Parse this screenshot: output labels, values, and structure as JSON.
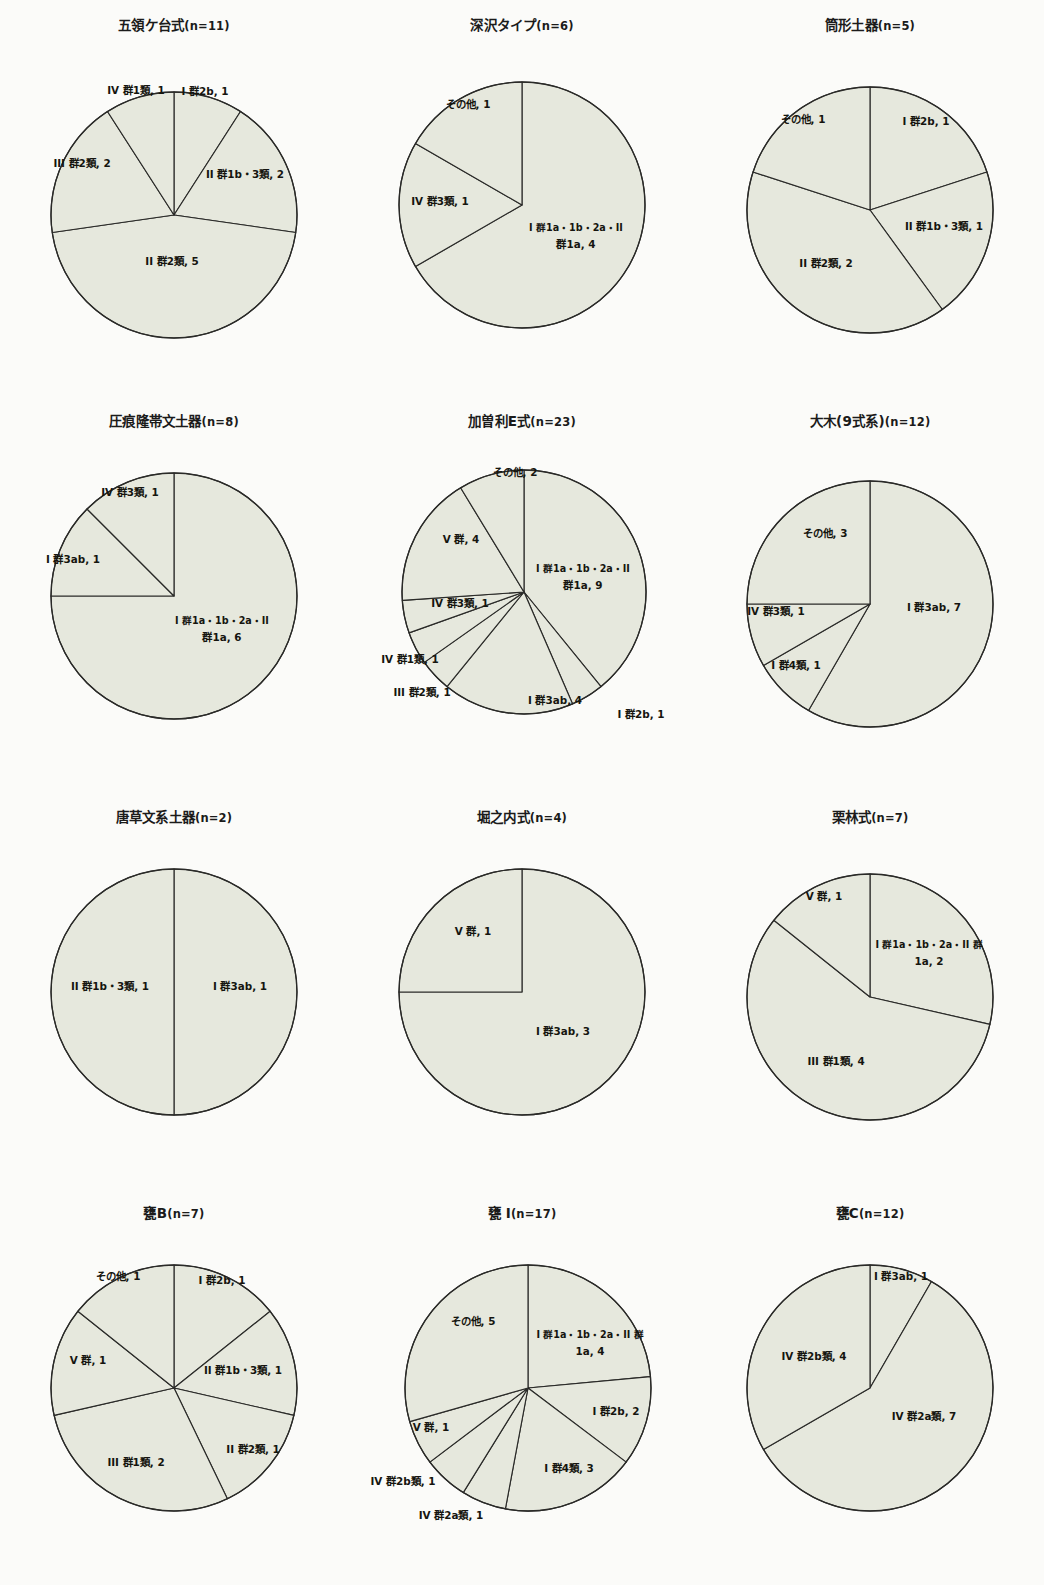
{
  "page": {
    "background_color": "#fbfbf9",
    "slice_fill_color": "#e6e8dd",
    "slice_stroke_color": "#2a2a28",
    "text_color": "#15150f",
    "columns": 3,
    "rows": 4
  },
  "chart_data": [
    {
      "type": "pie",
      "title": "五領ケ台式",
      "n_label": "(n=11)",
      "total": 11,
      "cx": 174,
      "cy": 215,
      "r": 123,
      "start_angle": 0,
      "direction": "clockwise",
      "categories": [
        "I 群2b",
        "II 群1b・3類",
        "II 群2類",
        "III 群2類",
        "IV 群1類"
      ],
      "values": [
        1,
        2,
        5,
        2,
        1
      ],
      "labels": [
        {
          "text": "I 群2b, 1",
          "x": 205,
          "y": 95,
          "anchor": "middle"
        },
        {
          "text": "II 群1b・3類, 2",
          "x": 245,
          "y": 178,
          "anchor": "middle"
        },
        {
          "text": "II 群2類, 5",
          "x": 172,
          "y": 265,
          "anchor": "middle"
        },
        {
          "text": "III 群2類, 2",
          "x": 82,
          "y": 167,
          "anchor": "middle"
        },
        {
          "text": "IV 群1類, 1",
          "x": 136,
          "y": 94,
          "anchor": "middle"
        }
      ]
    },
    {
      "type": "pie",
      "title": "深沢タイプ",
      "n_label": "(n=6)",
      "total": 6,
      "cx": 174,
      "cy": 205,
      "r": 123,
      "start_angle": 0,
      "direction": "clockwise",
      "categories": [
        "I 群1a・1b・2a・II 群1a",
        "IV 群3類",
        "その他"
      ],
      "values": [
        4,
        1,
        1
      ],
      "labels": [
        {
          "text": "I 群1a・1b・2a・II",
          "x": 228,
          "y": 231,
          "anchor": "middle"
        },
        {
          "text": "群1a, 4",
          "x": 228,
          "y": 248,
          "anchor": "middle"
        },
        {
          "text": "IV 群3類, 1",
          "x": 92,
          "y": 205,
          "anchor": "middle"
        },
        {
          "text": "その他, 1",
          "x": 120,
          "y": 108,
          "anchor": "middle"
        }
      ]
    },
    {
      "type": "pie",
      "title": "筒形土器",
      "n_label": "(n=5)",
      "total": 5,
      "cx": 174,
      "cy": 210,
      "r": 123,
      "start_angle": 0,
      "direction": "clockwise",
      "categories": [
        "I 群2b",
        "II 群1b・3類",
        "II 群2類",
        "その他"
      ],
      "values": [
        1,
        1,
        2,
        1
      ],
      "labels": [
        {
          "text": "I 群2b, 1",
          "x": 230,
          "y": 125,
          "anchor": "middle"
        },
        {
          "text": "II 群1b・3類, 1",
          "x": 248,
          "y": 230,
          "anchor": "middle"
        },
        {
          "text": "II 群2類, 2",
          "x": 130,
          "y": 267,
          "anchor": "middle"
        },
        {
          "text": "その他, 1",
          "x": 107,
          "y": 123,
          "anchor": "middle"
        }
      ]
    },
    {
      "type": "pie",
      "title": "圧痕隆帯文土器",
      "n_label": "(n=8)",
      "total": 8,
      "cx": 174,
      "cy": 200,
      "r": 123,
      "start_angle": 0,
      "direction": "clockwise",
      "categories": [
        "I 群1a・1b・2a・II 群1a",
        "I 群3ab",
        "IV 群3類"
      ],
      "values": [
        6,
        1,
        1
      ],
      "labels": [
        {
          "text": "I 群1a・1b・2a・II",
          "x": 222,
          "y": 228,
          "anchor": "middle"
        },
        {
          "text": "群1a, 6",
          "x": 222,
          "y": 245,
          "anchor": "middle"
        },
        {
          "text": "I 群3ab, 1",
          "x": 73,
          "y": 167,
          "anchor": "middle"
        },
        {
          "text": "IV 群3類, 1",
          "x": 130,
          "y": 100,
          "anchor": "middle"
        }
      ]
    },
    {
      "type": "pie",
      "title": "加曽利E式",
      "n_label": "(n=23)",
      "total": 23,
      "cx": 176,
      "cy": 196,
      "r": 122,
      "start_angle": 0,
      "direction": "clockwise",
      "categories": [
        "I 群1a・1b・2a・II 群1a",
        "I 群2b",
        "I 群3ab",
        "III 群2類",
        "IV 群1類",
        "IV 群3類",
        "V 群",
        "その他"
      ],
      "values": [
        9,
        1,
        4,
        1,
        1,
        1,
        4,
        2
      ],
      "labels": [
        {
          "text": "I 群1a・1b・2a・II",
          "x": 235,
          "y": 176,
          "anchor": "middle"
        },
        {
          "text": "群1a, 9",
          "x": 235,
          "y": 193,
          "anchor": "middle"
        },
        {
          "text": "I 群2b, 1",
          "x": 293,
          "y": 322,
          "anchor": "middle"
        },
        {
          "text": "I 群3ab, 4",
          "x": 207,
          "y": 308,
          "anchor": "middle"
        },
        {
          "text": "III 群2類, 1",
          "x": 74,
          "y": 300,
          "anchor": "middle"
        },
        {
          "text": "IV 群1類, 1",
          "x": 62,
          "y": 267,
          "anchor": "middle"
        },
        {
          "text": "IV 群3類, 1",
          "x": 112,
          "y": 211,
          "anchor": "middle"
        },
        {
          "text": "V 群, 4",
          "x": 113,
          "y": 147,
          "anchor": "middle"
        },
        {
          "text": "その他, 2",
          "x": 167,
          "y": 80,
          "anchor": "middle"
        }
      ]
    },
    {
      "type": "pie",
      "title": "大木(9式系)",
      "n_label": "(n=12)",
      "total": 12,
      "cx": 174,
      "cy": 208,
      "r": 123,
      "start_angle": 0,
      "direction": "clockwise",
      "categories": [
        "I 群3ab",
        "I 群4類",
        "IV 群3類",
        "その他"
      ],
      "values": [
        7,
        1,
        1,
        3
      ],
      "labels": [
        {
          "text": "I 群3ab, 7",
          "x": 238,
          "y": 215,
          "anchor": "middle"
        },
        {
          "text": "I 群4類, 1",
          "x": 100,
          "y": 273,
          "anchor": "middle"
        },
        {
          "text": "IV 群3類, 1",
          "x": 80,
          "y": 219,
          "anchor": "middle"
        },
        {
          "text": "その他, 3",
          "x": 129,
          "y": 141,
          "anchor": "middle"
        }
      ]
    },
    {
      "type": "pie",
      "title": "唐草文系土器",
      "n_label": "(n=2)",
      "total": 2,
      "cx": 174,
      "cy": 200,
      "r": 123,
      "start_angle": 0,
      "direction": "clockwise",
      "categories": [
        "I 群3ab",
        "II 群1b・3類"
      ],
      "values": [
        1,
        1
      ],
      "labels": [
        {
          "text": "I 群3ab, 1",
          "x": 240,
          "y": 198,
          "anchor": "middle"
        },
        {
          "text": "II 群1b・3類, 1",
          "x": 110,
          "y": 198,
          "anchor": "middle"
        }
      ]
    },
    {
      "type": "pie",
      "title": "堀之内式",
      "n_label": "(n=4)",
      "total": 4,
      "cx": 174,
      "cy": 200,
      "r": 123,
      "start_angle": 0,
      "direction": "clockwise",
      "categories": [
        "I 群3ab",
        "V 群"
      ],
      "values": [
        3,
        1
      ],
      "labels": [
        {
          "text": "I 群3ab, 3",
          "x": 215,
          "y": 243,
          "anchor": "middle"
        },
        {
          "text": "V 群, 1",
          "x": 125,
          "y": 143,
          "anchor": "middle"
        }
      ]
    },
    {
      "type": "pie",
      "title": "栗林式",
      "n_label": "(n=7)",
      "total": 7,
      "cx": 174,
      "cy": 205,
      "r": 123,
      "start_angle": 0,
      "direction": "clockwise",
      "categories": [
        "I 群1a・1b・2a・II 群1a",
        "III 群1類",
        "V 群"
      ],
      "values": [
        2,
        4,
        1
      ],
      "labels": [
        {
          "text": "I 群1a・1b・2a・II 群",
          "x": 233,
          "y": 156,
          "anchor": "middle"
        },
        {
          "text": "1a, 2",
          "x": 233,
          "y": 173,
          "anchor": "middle"
        },
        {
          "text": "III 群1類, 4",
          "x": 140,
          "y": 273,
          "anchor": "middle"
        },
        {
          "text": "V 群, 1",
          "x": 128,
          "y": 108,
          "anchor": "middle"
        }
      ]
    },
    {
      "type": "pie",
      "title": "甕B",
      "n_label": "(n=7)",
      "total": 7,
      "cx": 174,
      "cy": 200,
      "r": 123,
      "start_angle": 0,
      "direction": "clockwise",
      "categories": [
        "I 群2b",
        "II 群1b・3類",
        "II 群2類",
        "III 群1類",
        "V 群",
        "その他"
      ],
      "values": [
        1,
        1,
        1,
        2,
        1,
        1
      ],
      "labels": [
        {
          "text": "I 群2b, 1",
          "x": 222,
          "y": 96,
          "anchor": "middle"
        },
        {
          "text": "II 群1b・3類, 1",
          "x": 243,
          "y": 186,
          "anchor": "middle"
        },
        {
          "text": "II 群2類, 1",
          "x": 253,
          "y": 265,
          "anchor": "middle"
        },
        {
          "text": "III 群1類, 2",
          "x": 136,
          "y": 278,
          "anchor": "middle"
        },
        {
          "text": "V 群, 1",
          "x": 88,
          "y": 176,
          "anchor": "middle"
        },
        {
          "text": "その他, 1",
          "x": 118,
          "y": 92,
          "anchor": "middle"
        }
      ]
    },
    {
      "type": "pie",
      "title": "甕 I",
      "n_label": "(n=17)",
      "total": 17,
      "cx": 180,
      "cy": 200,
      "r": 123,
      "start_angle": 0,
      "direction": "clockwise",
      "categories": [
        "I 群1a・1b・2a・II 群1a",
        "I 群2b",
        "I 群4類",
        "IV 群2a類",
        "IV 群2b類",
        "V 群",
        "その他"
      ],
      "values": [
        4,
        2,
        3,
        1,
        1,
        1,
        5
      ],
      "labels": [
        {
          "text": "I 群1a・1b・2a・II 群",
          "x": 242,
          "y": 150,
          "anchor": "middle"
        },
        {
          "text": "1a, 4",
          "x": 242,
          "y": 167,
          "anchor": "middle"
        },
        {
          "text": "I 群2b, 2",
          "x": 268,
          "y": 227,
          "anchor": "middle"
        },
        {
          "text": "I 群4類, 3",
          "x": 221,
          "y": 284,
          "anchor": "middle"
        },
        {
          "text": "IV 群2a類, 1",
          "x": 103,
          "y": 331,
          "anchor": "middle"
        },
        {
          "text": "IV 群2b類, 1",
          "x": 55,
          "y": 297,
          "anchor": "middle"
        },
        {
          "text": "V 群, 1",
          "x": 83,
          "y": 243,
          "anchor": "middle"
        },
        {
          "text": "その他, 5",
          "x": 125,
          "y": 137,
          "anchor": "middle"
        }
      ]
    },
    {
      "type": "pie",
      "title": "甕C",
      "n_label": "(n=12)",
      "total": 12,
      "cx": 174,
      "cy": 200,
      "r": 123,
      "start_angle": 0,
      "direction": "clockwise",
      "categories": [
        "I 群3ab",
        "IV 群2a類",
        "IV 群2b類"
      ],
      "values": [
        1,
        7,
        4
      ],
      "labels": [
        {
          "text": "I 群3ab, 1",
          "x": 205,
          "y": 92,
          "anchor": "middle"
        },
        {
          "text": "IV 群2a類, 7",
          "x": 228,
          "y": 232,
          "anchor": "middle"
        },
        {
          "text": "IV 群2b類, 4",
          "x": 118,
          "y": 172,
          "anchor": "middle"
        }
      ]
    }
  ]
}
